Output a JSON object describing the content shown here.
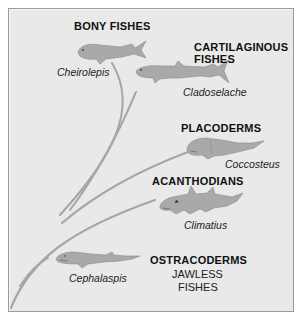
{
  "diagram": {
    "type": "evolutionary-tree",
    "branch_color": "#a6a6a6",
    "fish_fill": "#a9a9a9",
    "fish_outline": "#8c8c8c",
    "background": "#e9e9e9",
    "groups": [
      {
        "id": "bony",
        "label": "BONY FISHES",
        "genus": "Cheirolepis"
      },
      {
        "id": "cartilaginous",
        "label_line1": "CARTILAGINOUS",
        "label_line2": "FISHES",
        "genus": "Cladoselache"
      },
      {
        "id": "placoderms",
        "label": "PLACODERMS",
        "genus": "Coccosteus"
      },
      {
        "id": "acanthodians",
        "label": "ACANTHODIANS",
        "genus": "Climatius"
      },
      {
        "id": "ostracoderms",
        "label": "OSTRACODERMS",
        "sub_line1": "JAWLESS",
        "sub_line2": "FISHES",
        "genus": "Cephalaspis"
      }
    ]
  }
}
